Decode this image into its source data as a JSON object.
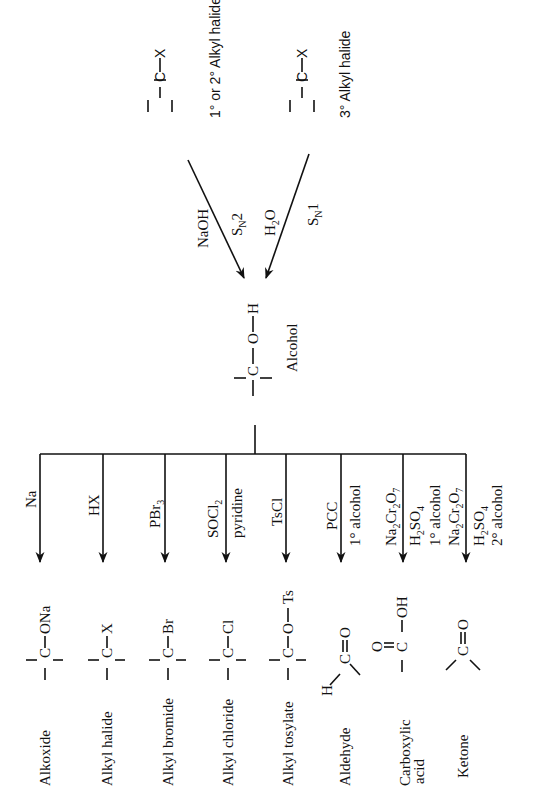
{
  "diagram": {
    "orientation": "rotated-90-ccw",
    "center": {
      "formula_parts": [
        "C",
        "O",
        "H"
      ],
      "label": "Alcohol"
    },
    "sources": [
      {
        "formula_parts": [
          "C",
          "X"
        ],
        "label": "1° or 2° Alkyl halide",
        "reagent": "NaOH",
        "mechanism": "SN2",
        "mechanism_main": "S",
        "mechanism_sub": "N",
        "mechanism_tail": "2"
      },
      {
        "formula_parts": [
          "C",
          "X"
        ],
        "label": "3° Alkyl halide",
        "reagent": "H2O",
        "reagent_main": "H",
        "reagent_sub": "2",
        "reagent_tail": "O",
        "mechanism": "SN1",
        "mechanism_main": "S",
        "mechanism_sub": "N",
        "mechanism_tail": "1"
      }
    ],
    "products": [
      {
        "label": "Alkoxide",
        "substituent": "ONa",
        "reagents": [
          "Na"
        ],
        "condition": ""
      },
      {
        "label": "Alkyl halide",
        "substituent": "X",
        "reagents": [
          "HX"
        ],
        "condition": ""
      },
      {
        "label": "Alkyl bromide",
        "substituent": "Br",
        "reagents": [
          "PBr3"
        ],
        "reagent_main": "PBr",
        "reagent_sub": "3",
        "condition": ""
      },
      {
        "label": "Alkyl chloride",
        "substituent": "Cl",
        "reagents": [
          "SOCl2",
          "pyridine"
        ],
        "reagent_main": "SOCl",
        "reagent_sub": "2",
        "condition": "pyridine"
      },
      {
        "label": "Alkyl tosylate",
        "substituent": "O — Ts",
        "sub_o": "O",
        "sub_ts": "Ts",
        "reagents": [
          "TsCl"
        ],
        "condition": ""
      },
      {
        "label": "Aldehyde",
        "formula_parts": [
          "H",
          "C",
          "O"
        ],
        "reagents": [
          "PCC"
        ],
        "condition": "1° alcohol"
      },
      {
        "label_line1": "Carboxylic",
        "label_line2": "acid",
        "label": "Carboxylic acid",
        "formula_parts": [
          "O",
          "C",
          "OH"
        ],
        "reagents": [
          "Na2Cr2O7",
          "H2SO4"
        ],
        "condition": "1° alcohol"
      },
      {
        "label": "Ketone",
        "formula_parts": [
          "C",
          "O"
        ],
        "reagents": [
          "Na2Cr2O7",
          "H2SO4"
        ],
        "condition": "2° alcohol"
      }
    ],
    "reagent_text": {
      "na2cr2o7": {
        "a": "Na",
        "b": "2",
        "c": "Cr",
        "d": "2",
        "e": "O",
        "f": "7"
      },
      "h2so4": {
        "a": "H",
        "b": "2",
        "c": "SO",
        "d": "4"
      }
    }
  }
}
